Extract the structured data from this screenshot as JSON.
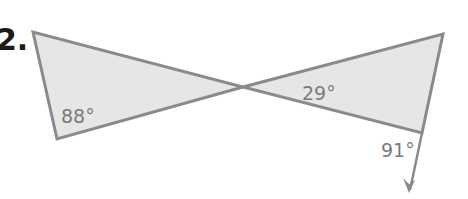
{
  "problem": {
    "number": "2."
  },
  "figure": {
    "type": "two triangles meeting at a vertex (vertical angles) with extended side",
    "fill_color": "#e6e6e6",
    "stroke_color": "#8a8a8a",
    "label_color": "#7a7a7a",
    "left_triangle": {
      "angle_label": "88°"
    },
    "right_triangle": {
      "interior_angle_label": "29°",
      "exterior_angle_label": "91°"
    }
  }
}
